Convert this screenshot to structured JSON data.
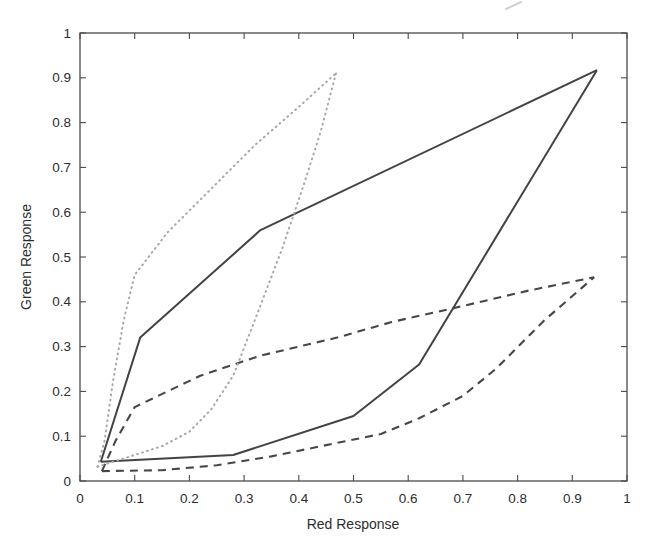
{
  "figure": {
    "background": "#ffffff",
    "axis_color": "#4a4a4a",
    "tick_label_color": "#2d2d2d"
  },
  "chart_data": {
    "type": "line",
    "title": "",
    "xlabel": "Red Response",
    "ylabel": "Green Response",
    "xlim": [
      0,
      1
    ],
    "ylim": [
      0,
      1
    ],
    "grid": false,
    "legend": "none",
    "x_ticks": [
      "0",
      "0.1",
      "0.2",
      "0.3",
      "0.4",
      "0.5",
      "0.6",
      "0.7",
      "0.8",
      "0.9",
      "1"
    ],
    "y_ticks": [
      "0",
      "0.1",
      "0.2",
      "0.3",
      "0.4",
      "0.5",
      "0.6",
      "0.7",
      "0.8",
      "0.9",
      "1"
    ],
    "series": [
      {
        "name": "solid loop — upper branch",
        "style": "solid",
        "color": "#434343",
        "width": 2,
        "points": [
          [
            0.038,
            0.043
          ],
          [
            0.11,
            0.32
          ],
          [
            0.33,
            0.56
          ],
          [
            0.945,
            0.917
          ]
        ]
      },
      {
        "name": "solid loop — lower branch",
        "style": "solid",
        "color": "#434343",
        "width": 2,
        "points": [
          [
            0.038,
            0.043
          ],
          [
            0.28,
            0.058
          ],
          [
            0.5,
            0.145
          ],
          [
            0.62,
            0.26
          ],
          [
            0.945,
            0.917
          ]
        ]
      },
      {
        "name": "dashed loop — upper branch",
        "style": "dashed",
        "color": "#474747",
        "width": 2.1,
        "points": [
          [
            0.04,
            0.022
          ],
          [
            0.065,
            0.09
          ],
          [
            0.1,
            0.165
          ],
          [
            0.16,
            0.2
          ],
          [
            0.22,
            0.235
          ],
          [
            0.33,
            0.28
          ],
          [
            0.47,
            0.32
          ],
          [
            0.57,
            0.355
          ],
          [
            0.68,
            0.385
          ],
          [
            0.82,
            0.425
          ],
          [
            0.94,
            0.455
          ]
        ]
      },
      {
        "name": "dashed loop — lower branch",
        "style": "dashed",
        "color": "#474747",
        "width": 2.1,
        "points": [
          [
            0.04,
            0.022
          ],
          [
            0.15,
            0.024
          ],
          [
            0.25,
            0.035
          ],
          [
            0.35,
            0.055
          ],
          [
            0.47,
            0.085
          ],
          [
            0.55,
            0.105
          ],
          [
            0.62,
            0.14
          ],
          [
            0.7,
            0.19
          ],
          [
            0.76,
            0.25
          ],
          [
            0.85,
            0.36
          ],
          [
            0.94,
            0.455
          ]
        ]
      },
      {
        "name": "dotted loop — left branch",
        "style": "dotted",
        "color": "#a6a6a6",
        "width": 2,
        "points": [
          [
            0.032,
            0.032
          ],
          [
            0.045,
            0.09
          ],
          [
            0.06,
            0.22
          ],
          [
            0.08,
            0.36
          ],
          [
            0.1,
            0.46
          ],
          [
            0.16,
            0.555
          ],
          [
            0.22,
            0.628
          ],
          [
            0.32,
            0.75
          ],
          [
            0.4,
            0.835
          ],
          [
            0.468,
            0.91
          ]
        ]
      },
      {
        "name": "dotted loop — right branch",
        "style": "dotted",
        "color": "#a6a6a6",
        "width": 2,
        "points": [
          [
            0.032,
            0.032
          ],
          [
            0.1,
            0.058
          ],
          [
            0.15,
            0.078
          ],
          [
            0.2,
            0.11
          ],
          [
            0.24,
            0.16
          ],
          [
            0.28,
            0.235
          ],
          [
            0.32,
            0.36
          ],
          [
            0.37,
            0.52
          ],
          [
            0.41,
            0.665
          ],
          [
            0.44,
            0.78
          ],
          [
            0.468,
            0.91
          ]
        ]
      }
    ]
  }
}
